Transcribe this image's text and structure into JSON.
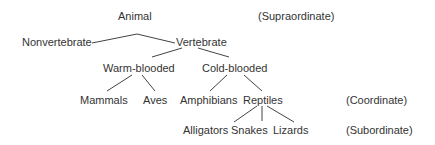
{
  "diagram": {
    "type": "taxonomy-tree",
    "line_color": "#444444",
    "text_color": "#333333",
    "nodes": {
      "animal": "Animal",
      "nonvertebrate": "Nonvertebrate",
      "vertebrate": "Vertebrate",
      "warm_blooded": "Warm-blooded",
      "cold_blooded": "Cold-blooded",
      "mammals": "Mammals",
      "aves": "Aves",
      "amphibians": "Amphibians",
      "reptiles": "Reptiles",
      "alligators": "Alligators",
      "snakes": "Snakes",
      "lizards": "Lizards"
    },
    "level_labels": {
      "supraordinate": "(Supraordinate)",
      "coordinate": "(Coordinate)",
      "subordinate": "(Subordinate)"
    },
    "edges": [
      [
        "animal",
        "nonvertebrate"
      ],
      [
        "animal",
        "vertebrate"
      ],
      [
        "vertebrate",
        "warm_blooded"
      ],
      [
        "vertebrate",
        "cold_blooded"
      ],
      [
        "warm_blooded",
        "mammals"
      ],
      [
        "warm_blooded",
        "aves"
      ],
      [
        "cold_blooded",
        "amphibians"
      ],
      [
        "cold_blooded",
        "reptiles"
      ],
      [
        "reptiles",
        "alligators"
      ],
      [
        "reptiles",
        "snakes"
      ],
      [
        "reptiles",
        "lizards"
      ]
    ]
  }
}
